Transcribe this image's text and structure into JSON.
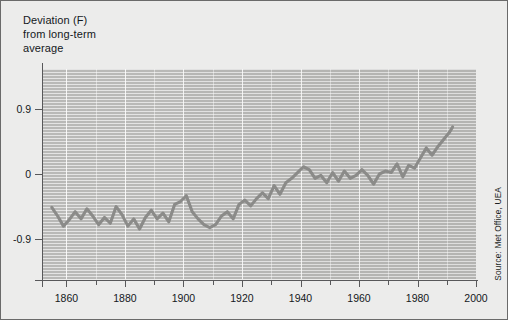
{
  "figure": {
    "title": "Deviation (F)\nfrom long-term\naverage",
    "source": "Source: Met Office, UEA",
    "colors": {
      "page_background": "#ffffff",
      "figure_background": "#ececeb",
      "plot_background": "#b9b9b7",
      "gridline": "#ffffff",
      "series_line": "#8b8b89",
      "axis": "#58585a",
      "border": "#6a6a6a",
      "text": "#14181c"
    }
  },
  "chart_data": {
    "type": "line",
    "title": "Deviation (F) from long-term average",
    "xlabel": "",
    "ylabel": "Deviation (F) from long-term average",
    "xlim": [
      1852,
      2000
    ],
    "ylim": [
      -1.45,
      1.45
    ],
    "grid": true,
    "legend_position": "none",
    "ytick_labels": [
      "0.9",
      "0",
      "-0.9"
    ],
    "ytick_values": [
      0.9,
      0,
      -0.9
    ],
    "xtick_labels": [
      "1860",
      "1880",
      "1900",
      "1920",
      "1940",
      "1960",
      "1980",
      "2000"
    ],
    "xtick_values": [
      1860,
      1880,
      1900,
      1920,
      1940,
      1960,
      1980,
      2000
    ],
    "xminor_step": 10,
    "annotations": [
      "Source: Met Office, UEA"
    ],
    "series": [
      {
        "name": "Global temperature deviation",
        "x": [
          1855,
          1857,
          1859,
          1861,
          1863,
          1865,
          1867,
          1869,
          1871,
          1873,
          1875,
          1877,
          1879,
          1881,
          1883,
          1885,
          1887,
          1889,
          1891,
          1893,
          1895,
          1897,
          1899,
          1901,
          1903,
          1905,
          1907,
          1909,
          1911,
          1913,
          1915,
          1917,
          1919,
          1921,
          1923,
          1925,
          1927,
          1929,
          1931,
          1933,
          1935,
          1937,
          1939,
          1941,
          1943,
          1945,
          1947,
          1949,
          1951,
          1953,
          1955,
          1957,
          1959,
          1961,
          1963,
          1965,
          1967,
          1969,
          1971,
          1973,
          1975,
          1977,
          1979,
          1981,
          1983,
          1985,
          1987,
          1989,
          1991,
          1992
        ],
        "y": [
          -0.46,
          -0.58,
          -0.72,
          -0.63,
          -0.52,
          -0.62,
          -0.48,
          -0.58,
          -0.7,
          -0.6,
          -0.68,
          -0.45,
          -0.56,
          -0.72,
          -0.62,
          -0.76,
          -0.6,
          -0.5,
          -0.62,
          -0.54,
          -0.66,
          -0.42,
          -0.38,
          -0.3,
          -0.52,
          -0.62,
          -0.7,
          -0.74,
          -0.7,
          -0.58,
          -0.52,
          -0.62,
          -0.42,
          -0.36,
          -0.44,
          -0.34,
          -0.26,
          -0.34,
          -0.16,
          -0.28,
          -0.12,
          -0.06,
          0.02,
          0.1,
          0.06,
          -0.06,
          -0.02,
          -0.12,
          0.02,
          -0.1,
          0.04,
          -0.06,
          -0.02,
          0.06,
          -0.02,
          -0.14,
          0.0,
          0.04,
          0.02,
          0.14,
          -0.04,
          0.12,
          0.08,
          0.22,
          0.36,
          0.26,
          0.38,
          0.48,
          0.58,
          0.65
        ]
      }
    ]
  },
  "axes": {
    "y_ticks": [
      {
        "label": "0.9",
        "value": 0.9
      },
      {
        "label": "0",
        "value": 0
      },
      {
        "label": "-0.9",
        "value": -0.9
      }
    ],
    "x_ticks": [
      {
        "label": "1860",
        "value": 1860
      },
      {
        "label": "1880",
        "value": 1880
      },
      {
        "label": "1900",
        "value": 1900
      },
      {
        "label": "1920",
        "value": 1920
      },
      {
        "label": "1940",
        "value": 1940
      },
      {
        "label": "1960",
        "value": 1960
      },
      {
        "label": "1980",
        "value": 1980
      },
      {
        "label": "2000",
        "value": 2000
      }
    ]
  }
}
